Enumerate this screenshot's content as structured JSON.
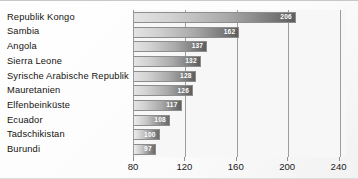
{
  "chart_data": {
    "type": "bar",
    "orientation": "horizontal",
    "title": "",
    "subtitle": "",
    "xlabel": "",
    "ylabel": "",
    "categories": [
      "Republik Kongo",
      "Sambia",
      "Angola",
      "Sierra Leone",
      "Syrische Arabische Republik",
      "Mauretanien",
      "Elfenbeinküste",
      "Ecuador",
      "Tadschikistan",
      "Burundi"
    ],
    "values": [
      206,
      162,
      137,
      132,
      128,
      126,
      117,
      108,
      100,
      97
    ],
    "data_labels": [
      "206",
      "162",
      "137",
      "132",
      "128",
      "126",
      "117",
      "108",
      "100",
      "97"
    ],
    "xlim": [
      80,
      245
    ],
    "xticks": [
      80,
      120,
      160,
      200,
      240
    ],
    "xticklabels": [
      "80",
      "120",
      "160",
      "200",
      "240"
    ],
    "grid": true,
    "grid_axis": "x",
    "legend": false,
    "legend_position": "none",
    "bar_fill_start": "#e3e3e3",
    "bar_fill_end": "#5e5e5e",
    "value_label_color": "#ffffff",
    "gridline_color": "#9e9e9e",
    "plot_background": "#f7f7f7",
    "axis_line_color": "#9a9a9a"
  }
}
